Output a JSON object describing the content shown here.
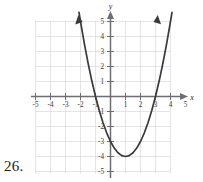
{
  "figure": {
    "problem_number": "26.",
    "axis_labels": {
      "x": "x",
      "y": "y"
    },
    "x_ticks": [
      "-5",
      "-4",
      "-3",
      "-2",
      "-1",
      "1",
      "2",
      "3",
      "4",
      "5"
    ],
    "y_ticks": [
      "5",
      "4",
      "3",
      "2",
      "1",
      "-1",
      "-2",
      "-3",
      "-4",
      "-5"
    ],
    "colors": {
      "grid": "#d7d7de",
      "axis": "#6e6e72",
      "curve": "#3a3a3a",
      "text": "#2b2b2b",
      "background": "#ffffff"
    }
  },
  "chart_data": {
    "type": "line",
    "title": "",
    "xlabel": "x",
    "ylabel": "y",
    "xlim": [
      -5,
      5
    ],
    "ylim": [
      -5,
      5
    ],
    "grid": true,
    "legend": "none",
    "annotations": [
      "parabola opens upward",
      "vertex at (1, -3)",
      "x-intercepts at x = -1 and x = 3",
      "y-intercept at y = -3",
      "arrowheads on both ends of the curve"
    ],
    "equation": "y = x^2 - 2x - 3",
    "vertex": [
      1,
      -3
    ],
    "x_intercepts": [
      -1,
      3
    ],
    "y_intercept": -3,
    "series": [
      {
        "name": "y = x^2 - 2x - 3",
        "x": [
          -2.1,
          -2.0,
          -1.75,
          -1.5,
          -1.25,
          -1.0,
          -0.75,
          -0.5,
          -0.25,
          0,
          0.25,
          0.5,
          0.75,
          1.0,
          1.25,
          1.5,
          1.75,
          2.0,
          2.25,
          2.5,
          2.75,
          3.0,
          3.25,
          3.5,
          3.75,
          4.0,
          4.1
        ],
        "y": [
          5.61,
          5.0,
          3.5625,
          2.25,
          1.0625,
          0,
          -0.9375,
          -1.75,
          -2.4375,
          -3,
          -3.4375,
          -3.75,
          -3.9375,
          -4,
          -3.9375,
          -3.75,
          -3.4375,
          -3,
          -2.4375,
          -1.75,
          -0.9375,
          0,
          1.0625,
          2.25,
          3.5625,
          5.0,
          5.61
        ]
      }
    ]
  }
}
